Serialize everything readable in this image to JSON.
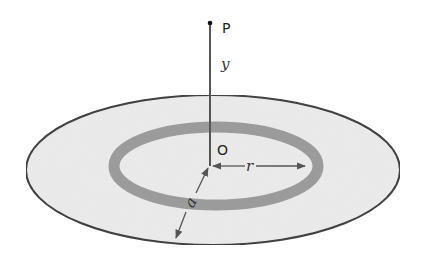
{
  "diagram": {
    "labels": {
      "point": "P",
      "origin": "O",
      "height": "y",
      "ring_radius": "r",
      "disk_radius": "a"
    },
    "colors": {
      "disk_fill": "#ececec",
      "ring_fill": "#9b9b9b",
      "outline": "#2e2e2e",
      "axis_line": "#555555",
      "arrow": "#555555"
    }
  }
}
